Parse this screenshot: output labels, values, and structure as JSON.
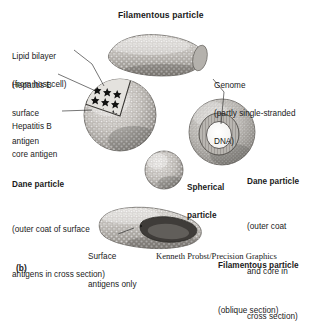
{
  "figure": {
    "panel_label": "(b)",
    "title": "Filamentous particle",
    "credit": "Kenneth Probst/Precision Graphics",
    "colors": {
      "ink": "#1a1a1a",
      "background": "#ffffff",
      "particle_light": "#d8d6d2",
      "particle_mid": "#9b9894",
      "particle_dark": "#4a4845",
      "core_antigen": "#111111"
    }
  },
  "callouts": [
    {
      "id": "lipid-bilayer",
      "line1": "Lipid bilayer",
      "line2": "(from host cell)"
    },
    {
      "id": "surface-antigen",
      "line1": "Hepatitis B",
      "line2": "surface",
      "line3": "antigen"
    },
    {
      "id": "core-antigen",
      "line1": "Hepatitis B",
      "line2": "core antigen"
    },
    {
      "id": "genome",
      "line1": "Genome",
      "line2": "(partly single-stranded",
      "line3": "DNA)"
    },
    {
      "id": "surface-antigens-only",
      "line1": "Surface",
      "line2": "antigens only"
    }
  ],
  "particles": [
    {
      "id": "dane-particle-surface",
      "name": "Dane particle",
      "note_line1": "(outer coat of surface",
      "note_line2": "antigens in cross section)"
    },
    {
      "id": "dane-particle-core",
      "name": "Dane particle",
      "note_line1": "(outer coat",
      "note_line2": "and core in",
      "note_line3": "cross section)"
    },
    {
      "id": "spherical-particle",
      "name_line1": "Spherical",
      "name_line2": "particle"
    },
    {
      "id": "filamentous-particle-oblique",
      "name": "Filamentous particle",
      "note_line1": "(oblique section)"
    }
  ]
}
